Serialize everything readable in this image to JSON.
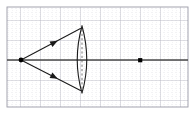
{
  "figure": {
    "title": "Converging lens ray diagram",
    "type": "optics-ray-diagram",
    "canvas": {
      "width": 195,
      "height": 114
    }
  },
  "colors": {
    "background": "#ffffff",
    "grid_minor": "#d8d8e0",
    "grid_major": "#b9b9c4",
    "border": "#9a9aa6",
    "axis": "#4a4a4a",
    "ray": "#1a1a1a",
    "lens_outline": "#1a1a1a",
    "lens_axis_dashed": "#555555",
    "point_marker": "#000000"
  },
  "grid": {
    "minor_spacing": 4,
    "major_spacing": 20,
    "show_minor": "true",
    "show_major": "true",
    "style_minor": "dotted",
    "style_major": "solid",
    "plot_area": {
      "x": 7,
      "y": 7,
      "width": 181,
      "height": 100
    }
  },
  "optical_axis": {
    "label": "principal axis",
    "y": 60,
    "x_start": 7,
    "x_end": 188,
    "stroke_width": 1.4
  },
  "lens": {
    "label": "biconvex converging lens",
    "center_x": 82,
    "center_y": 60,
    "top_y": 26,
    "bottom_y": 93,
    "half_thickness": 9,
    "outline_width": 1.1,
    "center_line_style": "dashed"
  },
  "source_point": {
    "label": "object point",
    "x": 21,
    "y": 60,
    "radius": 2.4
  },
  "focal_point": {
    "label": "image / focal point",
    "x": 140,
    "y": 60,
    "size": 4.2
  },
  "rays": [
    {
      "name": "upper-ray",
      "from": {
        "x": 21,
        "y": 60
      },
      "to": {
        "x": 80,
        "y": 29
      },
      "arrow_at": {
        "x": 51,
        "y": 45
      },
      "arrow_angle": -27
    },
    {
      "name": "lower-ray",
      "from": {
        "x": 21,
        "y": 60
      },
      "to": {
        "x": 80,
        "y": 90
      },
      "arrow_at": {
        "x": 51,
        "y": 75
      },
      "arrow_angle": 27
    }
  ]
}
